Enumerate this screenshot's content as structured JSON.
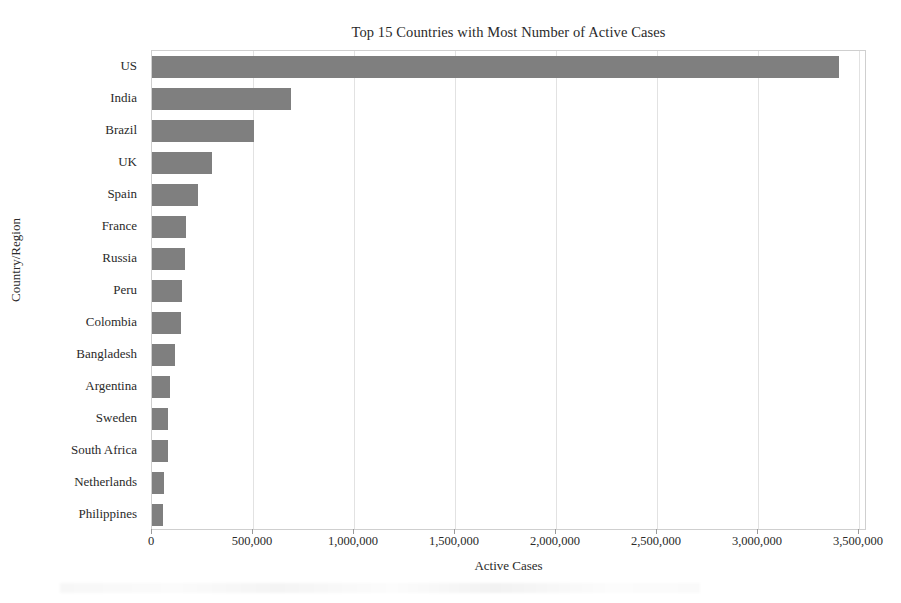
{
  "chart_data": {
    "type": "bar",
    "orientation": "horizontal",
    "title": "Top 15 Countries with Most Number of Active Cases",
    "xlabel": "Active Cases",
    "ylabel": "Country/Region",
    "categories": [
      "US",
      "India",
      "Brazil",
      "UK",
      "Spain",
      "France",
      "Russia",
      "Peru",
      "Colombia",
      "Bangladesh",
      "Argentina",
      "Sweden",
      "South Africa",
      "Netherlands",
      "Philippines"
    ],
    "values": [
      3400000,
      690000,
      505000,
      298000,
      228000,
      168000,
      163000,
      149000,
      144000,
      114000,
      89000,
      79000,
      78000,
      59000,
      54000
    ],
    "xlim": [
      0,
      3540000
    ],
    "xticks": [
      0,
      500000,
      1000000,
      1500000,
      2000000,
      2500000,
      3000000,
      3500000
    ],
    "xtick_labels": [
      "0",
      "500,000",
      "1,000,000",
      "1,500,000",
      "2,000,000",
      "2,500,000",
      "3,000,000",
      "3,500,000"
    ],
    "grid": "vertical-only",
    "legend": null,
    "bar_color": "#7f7f7f",
    "grid_color": "#e2e2e2",
    "axis_color": "#cfcfcf",
    "background_color": "#ffffff"
  }
}
